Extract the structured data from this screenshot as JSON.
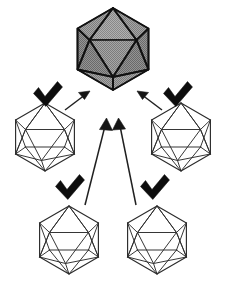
{
  "figure": {
    "title": "Four wireframe icosahedra with check marks pointing to one shaded icosahedron",
    "background_color": "#ffffff",
    "canvas": {
      "width": 226,
      "height": 297
    }
  },
  "colors": {
    "wireframe_stroke": "#2b2b2b",
    "shaded_fill_light": "#9b9b9b",
    "shaded_fill_mid": "#8a8a8a",
    "shaded_fill_dark": "#767676",
    "shaded_outline": "#111111",
    "arrow": "#202020",
    "check": "#0d0d0d"
  },
  "nodes": {
    "target": {
      "id": "target-icosahedron",
      "label": "shaded-icosahedron",
      "style": "filled-shaded",
      "center": {
        "x": 113,
        "y": 49
      },
      "radius": 41
    },
    "sources": [
      {
        "id": "source-left",
        "label": "wireframe-icosahedron-left",
        "style": "wireframe",
        "center": {
          "x": 45,
          "y": 137
        },
        "radius": 34,
        "check": {
          "x": 48,
          "y": 95,
          "size": 30
        }
      },
      {
        "id": "source-right",
        "label": "wireframe-icosahedron-right",
        "style": "wireframe",
        "center": {
          "x": 181,
          "y": 137
        },
        "radius": 34,
        "check": {
          "x": 178,
          "y": 95,
          "size": 30
        }
      },
      {
        "id": "source-bottom-left",
        "label": "wireframe-icosahedron-bottom-left",
        "style": "wireframe",
        "center": {
          "x": 69,
          "y": 240
        },
        "radius": 34,
        "check": {
          "x": 70,
          "y": 188,
          "size": 30
        }
      },
      {
        "id": "source-bottom-right",
        "label": "wireframe-icosahedron-bottom-right",
        "style": "wireframe",
        "center": {
          "x": 157,
          "y": 240
        },
        "radius": 34,
        "check": {
          "x": 155,
          "y": 188,
          "size": 30
        }
      }
    ]
  },
  "arrows": [
    {
      "id": "arrow-left-to-target",
      "label": "arrow-from-left-icosahedron",
      "from": {
        "x": 65,
        "y": 110
      },
      "to": {
        "x": 88,
        "y": 92
      },
      "length_px": 29
    },
    {
      "id": "arrow-right-to-target",
      "label": "arrow-from-right-icosahedron",
      "from": {
        "x": 162,
        "y": 110
      },
      "to": {
        "x": 140,
        "y": 92
      },
      "length_px": 29
    },
    {
      "id": "arrow-bottom-left-to-target",
      "label": "arrow-from-bottom-left-icosahedron",
      "from": {
        "x": 85,
        "y": 205
      },
      "to": {
        "x": 106,
        "y": 120
      },
      "length_px": 88
    },
    {
      "id": "arrow-bottom-right-to-target",
      "label": "arrow-from-bottom-right-icosahedron",
      "from": {
        "x": 136,
        "y": 205
      },
      "to": {
        "x": 119,
        "y": 120
      },
      "length_px": 87
    }
  ],
  "checks": {
    "glyph_name": "check-mark",
    "count": 4
  },
  "legend": {
    "note": ""
  }
}
